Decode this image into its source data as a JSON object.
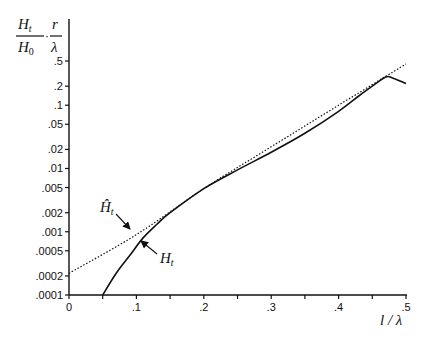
{
  "chart_data": {
    "type": "line",
    "title": "",
    "xlabel": "l / λ",
    "ylabel": "H_t / H_0 · r / λ",
    "ylabel_parts": {
      "num1": "H",
      "num1_sub": "t",
      "den1": "H",
      "den1_sub": "0",
      "num2": "r",
      "den2": "λ"
    },
    "x_scale": "linear",
    "y_scale": "log",
    "xlim": [
      0,
      0.5
    ],
    "ylim": [
      0.0001,
      0.5
    ],
    "grid": false,
    "x_ticks": [
      0,
      0.05,
      0.1,
      0.15,
      0.2,
      0.25,
      0.3,
      0.35,
      0.4,
      0.45,
      0.5
    ],
    "x_tick_labels": [
      "0",
      "",
      ".1",
      "",
      ".2",
      "",
      ".3",
      "",
      ".4",
      "",
      ".5"
    ],
    "y_ticks": [
      0.0001,
      0.0002,
      0.0005,
      0.001,
      0.002,
      0.005,
      0.01,
      0.02,
      0.05,
      0.1,
      0.2,
      0.5
    ],
    "y_tick_labels": [
      ".0001",
      ".0002",
      ".0005",
      ".001",
      ".002",
      ".005",
      ".01",
      ".02",
      ".05",
      ".1",
      ".2",
      ".5"
    ],
    "series": [
      {
        "name": "Ĥ_t",
        "label": "Ĥ",
        "label_sub": "t",
        "style": "dotted",
        "x": [
          0,
          0.1,
          0.2,
          0.3,
          0.4,
          0.5
        ],
        "values": [
          0.00022,
          0.0009,
          0.0048,
          0.022,
          0.1,
          0.45
        ]
      },
      {
        "name": "H_t",
        "label": "H",
        "label_sub": "t",
        "style": "solid",
        "x": [
          0.05,
          0.07,
          0.09,
          0.11,
          0.13,
          0.15,
          0.2,
          0.25,
          0.3,
          0.35,
          0.4,
          0.43,
          0.45,
          0.47,
          0.48,
          0.5
        ],
        "values": [
          0.0001,
          0.00022,
          0.00042,
          0.0008,
          0.0013,
          0.002,
          0.0048,
          0.0095,
          0.018,
          0.036,
          0.08,
          0.14,
          0.2,
          0.28,
          0.27,
          0.22
        ]
      }
    ],
    "annotations": [
      {
        "text": "Ĥ_t",
        "target_series": "Ĥ_t",
        "arrow": true
      },
      {
        "text": "H_t",
        "target_series": "H_t",
        "arrow": true
      }
    ]
  }
}
